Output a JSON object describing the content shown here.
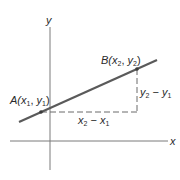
{
  "diagram": {
    "type": "slope-of-line",
    "axes": {
      "x_label": "x",
      "y_label": "y"
    },
    "points": [
      {
        "id": "A",
        "label_prefix": "A(",
        "coord1": "x",
        "sub1": "1",
        "sep": ", ",
        "coord2": "y",
        "sub2": "1",
        "suffix": ")"
      },
      {
        "id": "B",
        "label_prefix": "B(",
        "coord1": "x",
        "sub1": "2",
        "sep": ", ",
        "coord2": "y",
        "sub2": "2",
        "suffix": ")"
      }
    ],
    "run_label": {
      "a": "x",
      "a_sub": "2",
      "op": " − ",
      "b": "x",
      "b_sub": "1"
    },
    "rise_label": {
      "a": "y",
      "a_sub": "2",
      "op": " − ",
      "b": "y",
      "b_sub": "1"
    },
    "colors": {
      "line": "#5a5a5a",
      "axis": "#7a7a7a",
      "dash": "#6a6a6a",
      "text": "#2a2a2a"
    }
  }
}
